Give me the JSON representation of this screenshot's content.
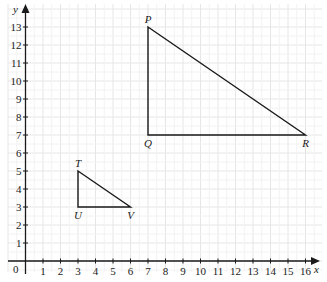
{
  "diagram": {
    "type": "coordinate-grid",
    "axes": {
      "x_label": "x",
      "y_label": "y",
      "origin_label": "0",
      "x_range": [
        0,
        16
      ],
      "y_range": [
        0,
        13
      ],
      "x_ticks": [
        1,
        2,
        3,
        4,
        5,
        6,
        7,
        8,
        9,
        10,
        11,
        12,
        13,
        14,
        15,
        16
      ],
      "y_ticks": [
        1,
        2,
        3,
        4,
        5,
        6,
        7,
        8,
        9,
        10,
        11,
        12,
        13
      ]
    },
    "grid": {
      "on": true,
      "color": "#e6e6e6"
    },
    "shapes": [
      {
        "name": "triangle-PQR",
        "vertices": [
          {
            "label": "P",
            "x": 7,
            "y": 13,
            "label_pos": "above"
          },
          {
            "label": "Q",
            "x": 7,
            "y": 7,
            "label_pos": "below"
          },
          {
            "label": "R",
            "x": 16,
            "y": 7,
            "label_pos": "below"
          }
        ]
      },
      {
        "name": "triangle-TUV",
        "vertices": [
          {
            "label": "T",
            "x": 3,
            "y": 5,
            "label_pos": "above"
          },
          {
            "label": "U",
            "x": 3,
            "y": 3,
            "label_pos": "below"
          },
          {
            "label": "V",
            "x": 6,
            "y": 3,
            "label_pos": "below"
          }
        ]
      }
    ],
    "colors": {
      "axis": "#1a1a1a",
      "shape": "#1a1a1a"
    }
  }
}
